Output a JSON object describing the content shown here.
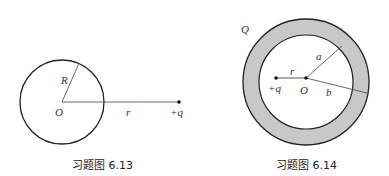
{
  "figures": [
    {
      "caption": "习题图 6.13",
      "labels": {
        "radius": "R",
        "center": "O",
        "distance": "r",
        "charge": "+q"
      }
    },
    {
      "caption": "习题图 6.14",
      "labels": {
        "shell_charge": "Q",
        "inner_radius": "a",
        "outer_radius": "b",
        "distance": "r",
        "center": "O",
        "charge": "+q"
      },
      "colors": {
        "shell_fill": "#c8c8c8"
      }
    }
  ]
}
